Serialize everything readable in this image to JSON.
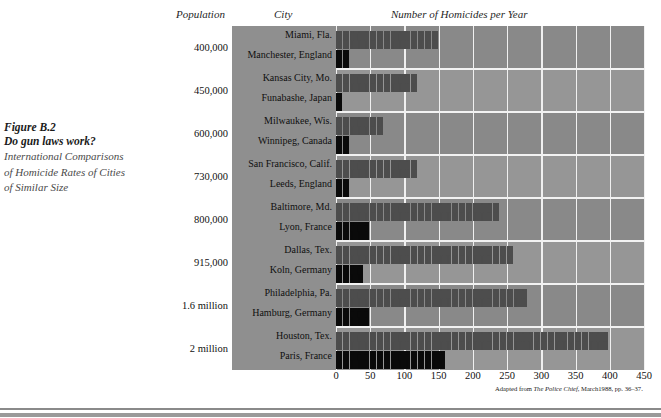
{
  "caption": {
    "figure_number": "Figure B.2",
    "title": "Do gun laws work?",
    "subtitle_line1": "International Comparisons",
    "subtitle_line2": "of Homicide Rates of Cities",
    "subtitle_line3": "of Similar Size"
  },
  "headers": {
    "population": "Population",
    "city": "City",
    "homicides": "Number of Homicides per Year"
  },
  "source_note": {
    "prefix": "Adapted from ",
    "publication": "The Police Chief",
    "suffix": ", March1988, pp. 36–37."
  },
  "colors": {
    "plot_background": "#8f8f8f",
    "band_dark": "#898989",
    "band_light": "#969696",
    "gridline": "#f0f0f0",
    "figure_us": "#4d4d4d",
    "figure_international": "#0a0a0a"
  },
  "chart_data": {
    "type": "bar",
    "title": "Number of Homicides per Year",
    "subtitle": "Do gun laws work? International Comparisons of Homicide Rates of Cities of Similar Size",
    "xlabel": "Number of Homicides per Year",
    "ylabel": "City",
    "xlim": [
      0,
      450
    ],
    "xticks": [
      0,
      50,
      100,
      150,
      200,
      250,
      300,
      350,
      400,
      450
    ],
    "grid": true,
    "legend": null,
    "pictogram_unit": 10,
    "groups": [
      {
        "population": "400,000",
        "pair": [
          {
            "city": "Miami, Fla.",
            "country": "United States",
            "value": 150,
            "type": "us"
          },
          {
            "city": "Manchester, England",
            "country": "England",
            "value": 20,
            "type": "intl"
          }
        ]
      },
      {
        "population": "450,000",
        "pair": [
          {
            "city": "Kansas City, Mo.",
            "country": "United States",
            "value": 120,
            "type": "us"
          },
          {
            "city": "Funabashe, Japan",
            "country": "Japan",
            "value": 10,
            "type": "intl"
          }
        ]
      },
      {
        "population": "600,000",
        "pair": [
          {
            "city": "Milwaukee, Wis.",
            "country": "United States",
            "value": 70,
            "type": "us"
          },
          {
            "city": "Winnipeg, Canada",
            "country": "Canada",
            "value": 20,
            "type": "intl"
          }
        ]
      },
      {
        "population": "730,000",
        "pair": [
          {
            "city": "San Francisco, Calif.",
            "country": "United States",
            "value": 120,
            "type": "us"
          },
          {
            "city": "Leeds, England",
            "country": "England",
            "value": 20,
            "type": "intl"
          }
        ]
      },
      {
        "population": "800,000",
        "pair": [
          {
            "city": "Baltimore, Md.",
            "country": "United States",
            "value": 240,
            "type": "us"
          },
          {
            "city": "Lyon, France",
            "country": "France",
            "value": 50,
            "type": "intl"
          }
        ]
      },
      {
        "population": "915,000",
        "pair": [
          {
            "city": "Dallas, Tex.",
            "country": "United States",
            "value": 260,
            "type": "us"
          },
          {
            "city": "Koln, Germany",
            "country": "Germany",
            "value": 40,
            "type": "intl"
          }
        ]
      },
      {
        "population": "1.6 million",
        "pair": [
          {
            "city": "Philadelphia, Pa.",
            "country": "United States",
            "value": 280,
            "type": "us"
          },
          {
            "city": "Hamburg, Germany",
            "country": "Germany",
            "value": 50,
            "type": "intl"
          }
        ]
      },
      {
        "population": "2 million",
        "pair": [
          {
            "city": "Houston, Tex.",
            "country": "United States",
            "value": 400,
            "type": "us"
          },
          {
            "city": "Paris, France",
            "country": "France",
            "value": 155,
            "type": "intl"
          }
        ]
      }
    ]
  }
}
